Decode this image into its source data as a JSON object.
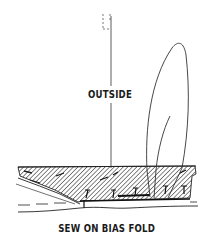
{
  "diagram": {
    "labels": {
      "outside": "OUTSIDE",
      "caption": "SEW ON BIAS FOLD"
    },
    "colors": {
      "ink": "#1a1a1a",
      "background": "#ffffff"
    },
    "elements": [
      "vertical-guide-line",
      "dashed-top-bracket",
      "bias-tape-loop",
      "hatched-fabric-band",
      "stitch-marks",
      "lower-fabric-edge"
    ]
  }
}
